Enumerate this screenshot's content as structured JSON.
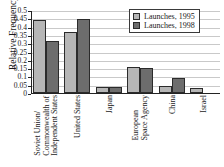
{
  "chart_data": {
    "type": "bar",
    "title": "",
    "xlabel": "",
    "ylabel": "Relative Frequency",
    "ylim": [
      0,
      0.5
    ],
    "grid": true,
    "legend_position": "top-right",
    "categories": [
      "Soviet Union/ Commonwealth of Independent States",
      "United States",
      "Japan",
      "European Space Agency",
      "China",
      "Israel"
    ],
    "category_lines": [
      [
        "Soviet Union/",
        "Commonwealth of",
        "Independent States"
      ],
      [
        "United States"
      ],
      [
        "Japan"
      ],
      [
        "European",
        "Space Agency"
      ],
      [
        "China"
      ],
      [
        "Israel"
      ]
    ],
    "ytick_labels": [
      "0",
      "0.05",
      "0.1",
      "0.15",
      "0.2",
      "0.25",
      "0.3",
      "0.35",
      "0.4",
      "0.45",
      "0.5"
    ],
    "ytick_values": [
      0,
      0.05,
      0.1,
      0.15,
      0.2,
      0.25,
      0.3,
      0.35,
      0.4,
      0.45,
      0.5
    ],
    "series": [
      {
        "name": "Launches, 1995",
        "color": "#b6b6b6",
        "values": [
          0.437,
          0.368,
          0.037,
          0.155,
          0.04,
          0.028
        ]
      },
      {
        "name": "Launches, 1998",
        "color": "#6d6d6d",
        "values": [
          0.315,
          0.447,
          0.037,
          0.148,
          0.088,
          0
        ]
      }
    ]
  },
  "legend": {
    "entries": [
      {
        "label": "Launches, 1995"
      },
      {
        "label": "Launches, 1998"
      }
    ]
  },
  "axes": {
    "y_title": "Relative Frequency"
  },
  "colors": {
    "series_1995": "#b6b6b6",
    "series_1998": "#6d6d6d",
    "axis": "#232323",
    "grid": "#c9c9c9",
    "background": "#ffffff"
  }
}
